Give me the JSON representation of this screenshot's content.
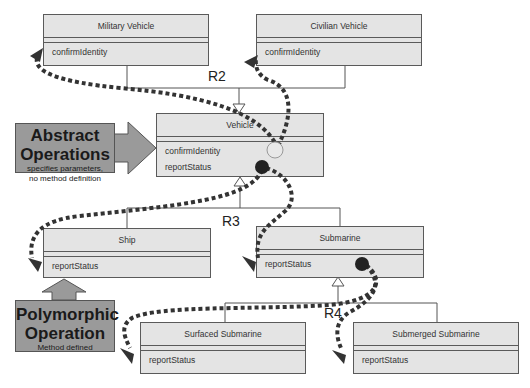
{
  "classes": {
    "military": {
      "name": "Military Vehicle",
      "ops": [
        "confirmIdentity"
      ]
    },
    "civilian": {
      "name": "Civilian Vehicle",
      "ops": [
        "confirmIdentity"
      ]
    },
    "vehicle": {
      "name": "Vehicle",
      "ops": [
        "confirmIdentity",
        "reportStatus"
      ]
    },
    "ship": {
      "name": "Ship",
      "ops": [
        "reportStatus"
      ]
    },
    "submarine": {
      "name": "Submarine",
      "ops": [
        "reportStatus"
      ]
    },
    "surfaced": {
      "name": "Surfaced Submarine",
      "ops": [
        "reportStatus"
      ]
    },
    "submerged": {
      "name": "Submerged Submarine",
      "ops": [
        "reportStatus"
      ]
    }
  },
  "relationships": {
    "r2": "R2",
    "r3": "R3",
    "r4": "R4"
  },
  "callouts": {
    "abstract": {
      "title_line1": "Abstract",
      "title_line2": "Operations",
      "desc_line1": "specifies parameters,",
      "desc_line2": "no method definition"
    },
    "polymorphic": {
      "title_line1": "Polymorphic",
      "title_line2": "Operation",
      "desc_line1": "Method defined"
    }
  },
  "colors": {
    "class_fill": "#e4e4e4",
    "class_border": "#5a5a5a",
    "callout_fill": "#9a9a9a",
    "dotted_path": "#333333"
  }
}
